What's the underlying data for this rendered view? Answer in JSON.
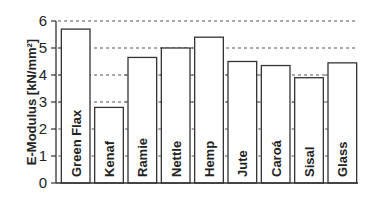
{
  "chart_data": {
    "type": "bar",
    "title": "",
    "xlabel": "",
    "ylabel": "E-Modulus [kN/mm²]",
    "categories": [
      "Green Flax",
      "Kenaf",
      "Ramie",
      "Nettle",
      "Hemp",
      "Jute",
      "Caroá",
      "Sisal",
      "Glass"
    ],
    "values": [
      5.7,
      2.8,
      4.65,
      5.0,
      5.4,
      4.5,
      4.35,
      3.9,
      4.45
    ],
    "ylim": [
      0,
      6
    ],
    "yticks": [
      0,
      1,
      2,
      3,
      4,
      5,
      6
    ],
    "gridlines": {
      "style": "dotted",
      "at": [
        3,
        4,
        5,
        6
      ]
    },
    "legend": null,
    "colors": {
      "bar_fill": "#ffffff",
      "bar_stroke": "#333333",
      "axis": "#333333",
      "grid": "#555555"
    }
  }
}
